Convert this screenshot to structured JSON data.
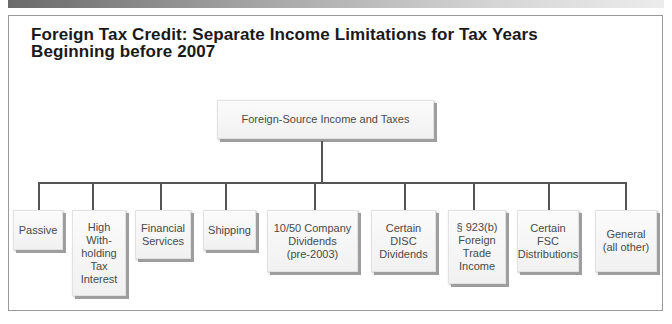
{
  "diagram": {
    "title": "Foreign Tax Credit: Separate Income Limitations for Tax Years\nBeginning before 2007",
    "root": {
      "label": "Foreign-Source Income and Taxes"
    },
    "children": [
      {
        "label": "Passive"
      },
      {
        "label": "High\nWith-\nholding\nTax\nInterest"
      },
      {
        "label": "Financial\nServices"
      },
      {
        "label": "Shipping"
      },
      {
        "label": "10/50 Company\nDividends\n(pre-2003)"
      },
      {
        "label": "Certain\nDISC\nDividends"
      },
      {
        "label": "§ 923(b)\nForeign\nTrade\nIncome"
      },
      {
        "label": "Certain\nFSC\nDistributions"
      },
      {
        "label": "General\n(all other)"
      }
    ],
    "colors": {
      "line": "#555555",
      "box_shadow": "#9e9e9e",
      "text": "#4a4a4a",
      "title": "#1a1a1a"
    }
  }
}
